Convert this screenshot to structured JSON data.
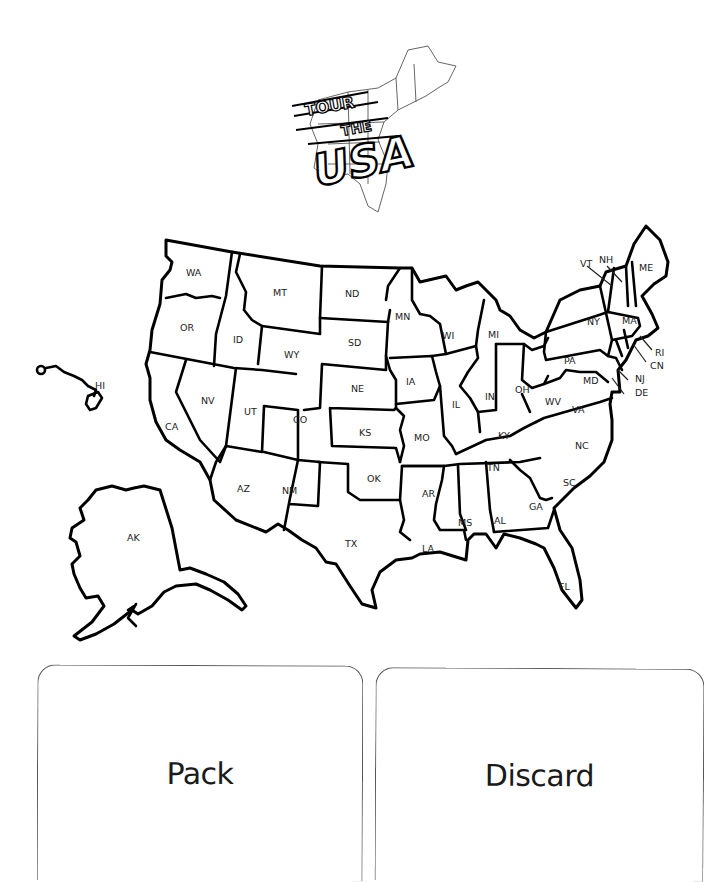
{
  "logo": {
    "line1": "TOUR",
    "line2": "THE",
    "line3": "USA"
  },
  "map": {
    "states": {
      "WA": "WA",
      "OR": "OR",
      "CA": "CA",
      "NV": "NV",
      "ID": "ID",
      "MT": "MT",
      "WY": "WY",
      "UT": "UT",
      "AZ": "AZ",
      "CO": "CO",
      "NM": "NM",
      "ND": "ND",
      "SD": "SD",
      "NE": "NE",
      "KS": "KS",
      "OK": "OK",
      "TX": "TX",
      "MN": "MN",
      "IA": "IA",
      "MO": "MO",
      "AR": "AR",
      "LA": "LA",
      "WI": "WI",
      "IL": "IL",
      "MI": "MI",
      "IN": "IN",
      "OH": "OH",
      "KY": "KY",
      "TN": "TN",
      "MS": "MS",
      "AL": "AL",
      "GA": "GA",
      "FL": "FL",
      "SC": "SC",
      "NC": "NC",
      "VA": "VA",
      "WV": "WV",
      "PA": "PA",
      "NY": "NY",
      "VT": "VT",
      "NH": "NH",
      "ME": "ME",
      "MA": "MA",
      "RI": "RI",
      "CN": "CN",
      "NJ": "NJ",
      "DE": "DE",
      "MD": "MD",
      "AK": "AK",
      "HI": "HI"
    }
  },
  "cards": {
    "pack": "Pack",
    "discard": "Discard"
  }
}
